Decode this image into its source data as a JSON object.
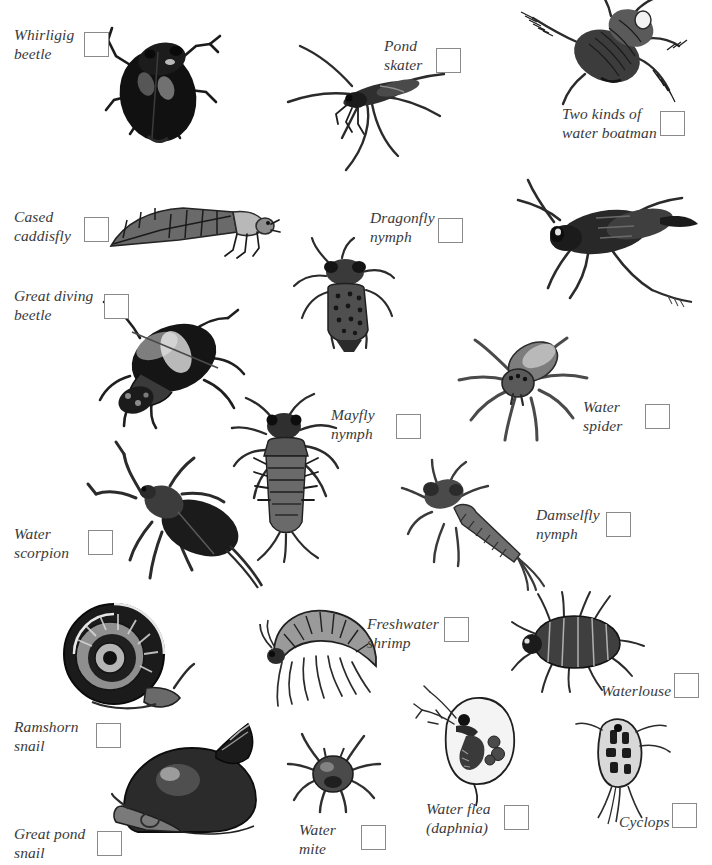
{
  "page": {
    "title_fragment_cut_off_at_top": "",
    "background_color": "#ffffff",
    "text_color": "#3a3a3a",
    "checkbox_border_color": "#8a8a8a",
    "width": 712,
    "height": 865
  },
  "entries": [
    {
      "id": "whirligig-beetle",
      "label": "Whirligig\nbeetle",
      "label_x": 14,
      "label_y": 25,
      "box_x": 84,
      "box_y": 32
    },
    {
      "id": "pond-skater",
      "label": "Pond\nskater",
      "label_x": 384,
      "label_y": 36,
      "box_x": 436,
      "box_y": 48
    },
    {
      "id": "water-boatman",
      "label": "Two kinds of\nwater boatman",
      "label_x": 562,
      "label_y": 104,
      "box_x": 660,
      "box_y": 111
    },
    {
      "id": "cased-caddisfly",
      "label": "Cased\ncaddisfly",
      "label_x": 14,
      "label_y": 207,
      "box_x": 84,
      "box_y": 217
    },
    {
      "id": "dragonfly-nymph",
      "label": "Dragonfly\nnymph",
      "label_x": 370,
      "label_y": 208,
      "box_x": 438,
      "box_y": 218
    },
    {
      "id": "great-diving-beetle",
      "label": "Great diving\nbeetle",
      "label_x": 14,
      "label_y": 286,
      "box_x": 104,
      "box_y": 294
    },
    {
      "id": "water-spider",
      "label": "Water\nspider",
      "label_x": 583,
      "label_y": 397,
      "box_x": 645,
      "box_y": 404
    },
    {
      "id": "mayfly-nymph",
      "label": "Mayfly\nnymph",
      "label_x": 331,
      "label_y": 405,
      "box_x": 396,
      "box_y": 414
    },
    {
      "id": "water-scorpion",
      "label": "Water\nscorpion",
      "label_x": 14,
      "label_y": 524,
      "box_x": 88,
      "box_y": 530
    },
    {
      "id": "damselfly-nymph",
      "label": "Damselfly\nnymph",
      "label_x": 536,
      "label_y": 505,
      "box_x": 606,
      "box_y": 512
    },
    {
      "id": "freshwater-shrimp",
      "label": "Freshwater\nshrimp",
      "label_x": 367,
      "label_y": 614,
      "box_x": 444,
      "box_y": 617
    },
    {
      "id": "waterlouse",
      "label": "Waterlouse",
      "label_x": 601,
      "label_y": 681,
      "box_x": 674,
      "box_y": 673
    },
    {
      "id": "ramshorn-snail",
      "label": "Ramshorn\nsnail",
      "label_x": 14,
      "label_y": 717,
      "box_x": 96,
      "box_y": 723
    },
    {
      "id": "water-mite",
      "label": "Water\nmite",
      "label_x": 299,
      "label_y": 820,
      "box_x": 361,
      "box_y": 825
    },
    {
      "id": "water-flea",
      "label": "Water flea\n(daphnia)",
      "label_x": 426,
      "label_y": 799,
      "box_x": 504,
      "box_y": 805
    },
    {
      "id": "cyclops",
      "label": "Cyclops",
      "label_x": 619,
      "label_y": 812,
      "box_x": 672,
      "box_y": 803
    },
    {
      "id": "great-pond-snail",
      "label": "Great pond\nsnail",
      "label_x": 14,
      "label_y": 824,
      "box_x": 97,
      "box_y": 831
    }
  ],
  "illustrations": [
    {
      "id": "whirligig-beetle-illustration",
      "x": 98,
      "y": 20,
      "w": 135,
      "h": 130
    },
    {
      "id": "pond-skater-illustration",
      "x": 285,
      "y": 45,
      "w": 165,
      "h": 130
    },
    {
      "id": "water-boatman-illustration",
      "x": 520,
      "y": 0,
      "w": 175,
      "h": 105
    },
    {
      "id": "water-boatman-2-illustration",
      "x": 505,
      "y": 180,
      "w": 190,
      "h": 125
    },
    {
      "id": "cased-caddisfly-illustration",
      "x": 108,
      "y": 200,
      "w": 165,
      "h": 62
    },
    {
      "id": "dragonfly-nymph-illustration",
      "x": 295,
      "y": 240,
      "w": 105,
      "h": 110
    },
    {
      "id": "great-diving-beetle-illustration",
      "x": 85,
      "y": 300,
      "w": 165,
      "h": 125
    },
    {
      "id": "water-spider-illustration",
      "x": 458,
      "y": 330,
      "w": 125,
      "h": 110
    },
    {
      "id": "mayfly-nymph-illustration",
      "x": 232,
      "y": 398,
      "w": 125,
      "h": 160
    },
    {
      "id": "water-scorpion-illustration",
      "x": 85,
      "y": 440,
      "w": 175,
      "h": 145
    },
    {
      "id": "damselfly-nymph-illustration",
      "x": 405,
      "y": 462,
      "w": 135,
      "h": 125
    },
    {
      "id": "ramshorn-snail-illustration",
      "x": 55,
      "y": 605,
      "w": 140,
      "h": 115
    },
    {
      "id": "freshwater-shrimp-illustration",
      "x": 262,
      "y": 608,
      "w": 120,
      "h": 105
    },
    {
      "id": "waterlouse-illustration",
      "x": 512,
      "y": 595,
      "w": 130,
      "h": 95
    },
    {
      "id": "great-pond-snail-illustration",
      "x": 115,
      "y": 727,
      "w": 150,
      "h": 110
    },
    {
      "id": "water-mite-illustration",
      "x": 292,
      "y": 735,
      "w": 85,
      "h": 75
    },
    {
      "id": "water-flea-illustration",
      "x": 415,
      "y": 690,
      "w": 110,
      "h": 110
    },
    {
      "id": "cyclops-illustration",
      "x": 570,
      "y": 718,
      "w": 95,
      "h": 105
    }
  ]
}
